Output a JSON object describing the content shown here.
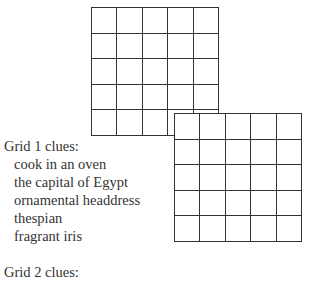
{
  "grids": [
    {
      "name": "grid-1",
      "rows": 5,
      "cols": 5
    },
    {
      "name": "grid-2",
      "rows": 5,
      "cols": 5
    }
  ],
  "clues": {
    "grid1_title": "Grid 1 clues:",
    "grid1": [
      "cook in an oven",
      "the capital of Egypt",
      "ornamental headdress",
      "thespian",
      "fragrant iris"
    ],
    "grid2_title": "Grid 2 clues:"
  }
}
